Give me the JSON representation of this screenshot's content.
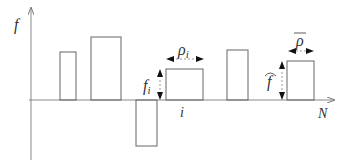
{
  "diagram": {
    "type": "bar-signal-diagram",
    "axes": {
      "y_label": "f",
      "x_label": "N",
      "x_tick_label": "i"
    },
    "annotations": {
      "f_i": "f",
      "f_i_sub": "i",
      "rho_i": "ρ",
      "rho_i_sub": "i",
      "f_hat": "f",
      "rho_bar": "ρ"
    },
    "bars": [
      {
        "x0": 60,
        "x1": 76,
        "top": 52,
        "sign": "positive"
      },
      {
        "x0": 91,
        "x1": 121,
        "top": 37,
        "sign": "positive"
      },
      {
        "x0": 136,
        "x1": 157,
        "bottom": 146,
        "sign": "negative"
      },
      {
        "x0": 166,
        "x1": 203,
        "top": 69,
        "sign": "positive"
      },
      {
        "x0": 227,
        "x1": 248,
        "top": 50,
        "sign": "positive"
      },
      {
        "x0": 287,
        "x1": 314,
        "top": 61,
        "sign": "positive"
      }
    ],
    "colors": {
      "line": "#555555",
      "text": "#333333",
      "arrow": "#111111"
    }
  }
}
